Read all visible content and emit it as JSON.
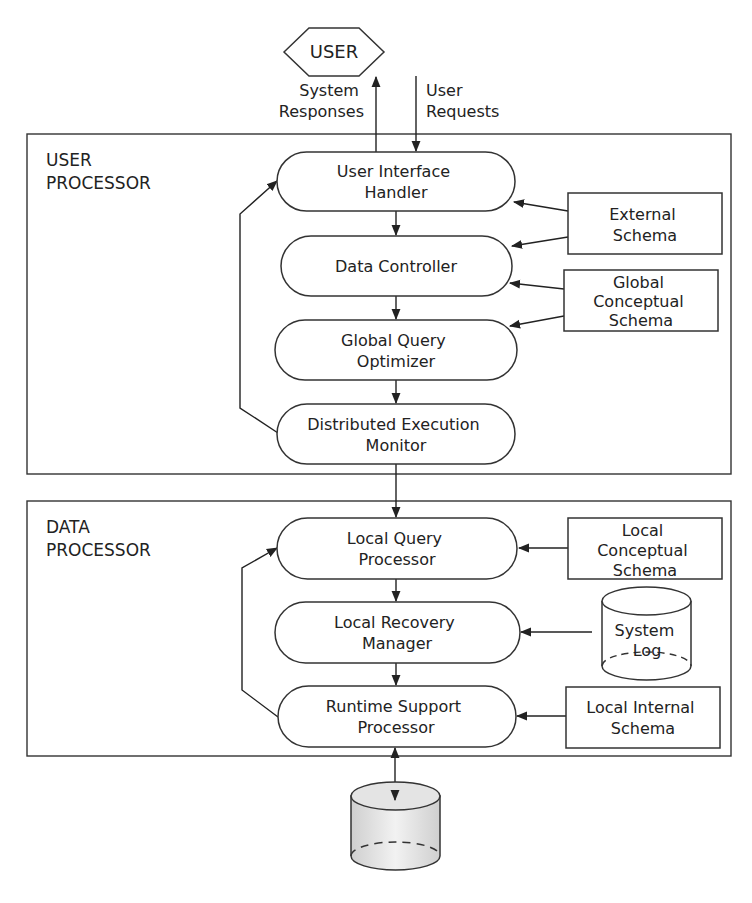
{
  "user": {
    "label": "USER"
  },
  "flows": {
    "system_responses": [
      "System",
      "Responses"
    ],
    "user_requests": [
      "User",
      "Requests"
    ]
  },
  "user_processor": {
    "title": [
      "USER",
      "PROCESSOR"
    ],
    "nodes": [
      {
        "id": "ui_handler",
        "lines": [
          "User Interface",
          "Handler"
        ]
      },
      {
        "id": "data_controller",
        "lines": [
          "Data Controller"
        ]
      },
      {
        "id": "global_query_optimizer",
        "lines": [
          "Global Query",
          "Optimizer"
        ]
      },
      {
        "id": "distributed_execution_monitor",
        "lines": [
          "Distributed Execution",
          "Monitor"
        ]
      }
    ],
    "schemas": [
      {
        "id": "external_schema",
        "lines": [
          "External",
          "Schema"
        ]
      },
      {
        "id": "global_conceptual_schema",
        "lines": [
          "Global",
          "Conceptual",
          "Schema"
        ]
      }
    ]
  },
  "data_processor": {
    "title": [
      "DATA",
      "PROCESSOR"
    ],
    "nodes": [
      {
        "id": "local_query_processor",
        "lines": [
          "Local Query",
          "Processor"
        ]
      },
      {
        "id": "local_recovery_manager",
        "lines": [
          "Local Recovery",
          "Manager"
        ]
      },
      {
        "id": "runtime_support_processor",
        "lines": [
          "Runtime Support",
          "Processor"
        ]
      }
    ],
    "schemas": [
      {
        "id": "local_conceptual_schema",
        "lines": [
          "Local",
          "Conceptual",
          "Schema"
        ]
      },
      {
        "id": "system_log",
        "lines": [
          "System",
          "Log"
        ]
      },
      {
        "id": "local_internal_schema",
        "lines": [
          "Local Internal",
          "Schema"
        ]
      }
    ]
  },
  "colors": {
    "stroke": "#333333",
    "text": "#222222",
    "database_fill": "#e6e6e6"
  }
}
